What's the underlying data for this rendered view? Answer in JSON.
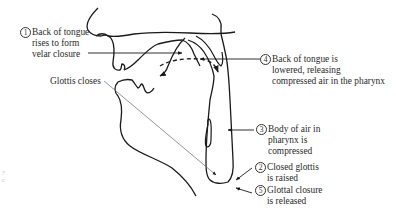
{
  "diagram": {
    "type": "vocal-tract sagittal cross-section",
    "colors": {
      "outline": "#1a1a1a",
      "pointer": "#7a7a7a",
      "text": "#2a2a2a",
      "background": "#ffffff"
    },
    "labels": [
      {
        "id": "1",
        "number": "1",
        "lines": [
          "Back of tongue",
          "rises to form",
          "velar closure"
        ]
      },
      {
        "id": "4",
        "number": "4",
        "lines": [
          "Back of tongue is",
          "lowered, releasing",
          "compressed air in the pharynx"
        ]
      },
      {
        "id": "glottis",
        "number": "",
        "lines": [
          "Glottis closes"
        ]
      },
      {
        "id": "3",
        "number": "3",
        "lines": [
          "Body of air in",
          "pharynx is",
          "compressed"
        ]
      },
      {
        "id": "2",
        "number": "2",
        "lines": [
          "Closed glottis",
          "is raised"
        ]
      },
      {
        "id": "5",
        "number": "5",
        "lines": [
          "Glottal closure",
          "is released"
        ]
      }
    ],
    "edge_marks": [
      "?",
      "c"
    ]
  }
}
